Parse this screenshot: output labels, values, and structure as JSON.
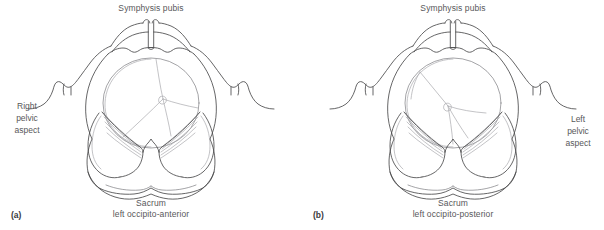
{
  "figure": {
    "type": "anatomical-line-diagram",
    "background_color": "#ffffff",
    "line_color": "#4a4a4c",
    "text_color": "#58585a",
    "panel_count": 2
  },
  "panels": [
    {
      "id": "a",
      "letter": "(a)",
      "top_label": "Symphysis pubis",
      "bottom_label_primary": "Sacrum",
      "bottom_label_secondary": "left occipito-anterior",
      "side_label_line1": "Right",
      "side_label_line2": "pelvic",
      "side_label_line3": "aspect",
      "side_label_position": "left",
      "position_name": "left occipito-anterior"
    },
    {
      "id": "b",
      "letter": "(b)",
      "top_label": "Symphysis pubis",
      "bottom_label_primary": "Sacrum",
      "bottom_label_secondary": "left occipito-posterior",
      "side_label_line1": "Left",
      "side_label_line2": "pelvic",
      "side_label_line3": "aspect",
      "side_label_position": "right",
      "position_name": "left occipito-posterior"
    }
  ],
  "anatomy_parts": [
    "symphysis pubis",
    "pubic bone",
    "iliac crest",
    "anterior superior iliac spine",
    "ischial spine",
    "ischial tuberosity",
    "sacrum",
    "coccyx",
    "sacrospinous ligament",
    "sacrotuberous ligament",
    "obturator foramen",
    "fetal head",
    "sagittal suture",
    "lambdoid suture",
    "posterior fontanelle"
  ]
}
